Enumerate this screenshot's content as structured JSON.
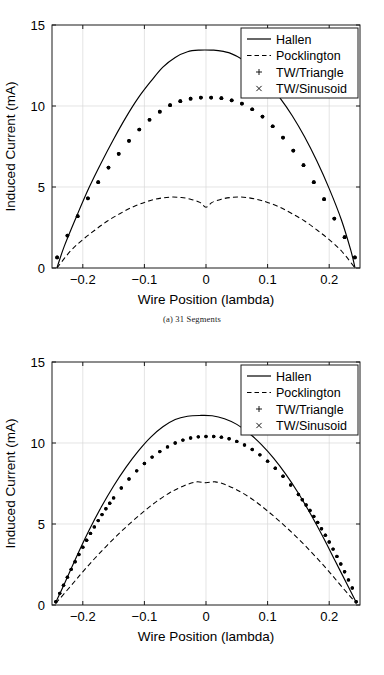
{
  "figure": {
    "panels": [
      {
        "id": "panel-a",
        "caption": "(a)  31 Segments",
        "caption_letter": "(a)",
        "caption_text": "31 Segments"
      },
      {
        "id": "panel-b",
        "caption": "(b)  81 Segments",
        "caption_letter": "(b)",
        "caption_text": "81 Segments"
      }
    ]
  },
  "axes": {
    "xlabel": "Wire Position (lambda)",
    "ylabel": "Induced Current (mA)",
    "xticks": [
      "-0.2",
      "-0.1",
      "0",
      "0.1",
      "0.2"
    ],
    "yticks": [
      "0",
      "5",
      "10",
      "15"
    ]
  },
  "legend": {
    "entries": [
      {
        "label": "Hallen",
        "style": "solid-line"
      },
      {
        "label": "Pocklington",
        "style": "dashed-line"
      },
      {
        "label": "TW/Triangle",
        "style": "plus-marker"
      },
      {
        "label": "TW/Sinusoid",
        "style": "cross-marker"
      }
    ]
  },
  "colors": {
    "line": "#000000",
    "frame": "#1a1a1a",
    "grid": "#d8d8d8",
    "background": "#ffffff"
  },
  "chart_data": [
    {
      "type": "line",
      "title": "(a) 31 Segments",
      "xlabel": "Wire Position (lambda)",
      "ylabel": "Induced Current (mA)",
      "xlim": [
        -0.25,
        0.25
      ],
      "ylim": [
        0,
        15
      ],
      "xticks": [
        -0.2,
        -0.1,
        0,
        0.1,
        0.2
      ],
      "yticks": [
        0,
        5,
        10,
        15
      ],
      "grid": true,
      "legend_position": "upper right",
      "series": [
        {
          "name": "Hallen",
          "style": "solid",
          "x": [
            -0.242,
            -0.23,
            -0.21,
            -0.19,
            -0.17,
            -0.15,
            -0.13,
            -0.11,
            -0.09,
            -0.07,
            -0.05,
            -0.03,
            -0.01,
            0.01,
            0.02,
            0.04,
            0.06,
            0.08,
            0.1,
            0.12,
            0.14,
            0.16,
            0.18,
            0.2,
            0.22,
            0.235,
            0.242
          ],
          "y": [
            0.0,
            1.35,
            3.2,
            4.95,
            6.5,
            7.95,
            9.3,
            10.5,
            11.5,
            12.4,
            13.0,
            13.35,
            13.45,
            13.45,
            13.42,
            13.25,
            12.85,
            12.25,
            11.45,
            10.5,
            9.4,
            8.1,
            6.6,
            4.9,
            2.95,
            1.1,
            0.0
          ]
        },
        {
          "name": "Pocklington",
          "style": "dashed",
          "x": [
            -0.242,
            -0.22,
            -0.2,
            -0.18,
            -0.16,
            -0.14,
            -0.12,
            -0.1,
            -0.085,
            -0.07,
            -0.055,
            -0.04,
            -0.025,
            -0.01,
            0.0,
            0.01,
            0.025,
            0.04,
            0.055,
            0.07,
            0.085,
            0.1,
            0.12,
            0.14,
            0.16,
            0.18,
            0.2,
            0.22,
            0.242
          ],
          "y": [
            0.0,
            1.05,
            1.75,
            2.35,
            2.9,
            3.35,
            3.75,
            4.05,
            4.22,
            4.33,
            4.38,
            4.35,
            4.25,
            4.05,
            3.75,
            4.05,
            4.25,
            4.35,
            4.38,
            4.33,
            4.22,
            4.05,
            3.75,
            3.35,
            2.9,
            2.35,
            1.75,
            1.05,
            0.0
          ]
        },
        {
          "name": "TW/Triangle",
          "style": "markers",
          "marker": "+",
          "x": [
            -0.2417,
            -0.225,
            -0.2083,
            -0.1917,
            -0.175,
            -0.1583,
            -0.1417,
            -0.125,
            -0.1083,
            -0.0917,
            -0.075,
            -0.0583,
            -0.0417,
            -0.025,
            -0.0083,
            0.0083,
            0.025,
            0.0417,
            0.0583,
            0.075,
            0.0917,
            0.1083,
            0.125,
            0.1417,
            0.1583,
            0.175,
            0.1917,
            0.2083,
            0.225,
            0.2417
          ],
          "y": [
            0.65,
            2.0,
            3.2,
            4.3,
            5.3,
            6.2,
            7.05,
            7.85,
            8.55,
            9.15,
            9.65,
            10.05,
            10.3,
            10.45,
            10.52,
            10.52,
            10.48,
            10.35,
            10.15,
            9.8,
            9.35,
            8.75,
            8.05,
            7.25,
            6.35,
            5.3,
            4.25,
            3.05,
            1.9,
            0.65
          ]
        },
        {
          "name": "TW/Sinusoid",
          "style": "markers",
          "marker": "x",
          "x": [
            -0.2417,
            -0.225,
            -0.2083,
            -0.1917,
            -0.175,
            -0.1583,
            -0.1417,
            -0.125,
            -0.1083,
            -0.0917,
            -0.075,
            -0.0583,
            -0.0417,
            -0.025,
            -0.0083,
            0.0083,
            0.025,
            0.0417,
            0.0583,
            0.075,
            0.0917,
            0.1083,
            0.125,
            0.1417,
            0.1583,
            0.175,
            0.1917,
            0.2083,
            0.225,
            0.2417
          ],
          "y": [
            0.65,
            2.0,
            3.2,
            4.3,
            5.3,
            6.2,
            7.05,
            7.85,
            8.55,
            9.15,
            9.65,
            10.05,
            10.3,
            10.45,
            10.52,
            10.52,
            10.48,
            10.35,
            10.15,
            9.8,
            9.35,
            8.75,
            8.05,
            7.25,
            6.35,
            5.3,
            4.25,
            3.05,
            1.9,
            0.65
          ]
        }
      ]
    },
    {
      "type": "line",
      "title": "(b) 81 Segments",
      "xlabel": "Wire Position (lambda)",
      "ylabel": "Induced Current (mA)",
      "xlim": [
        -0.25,
        0.25
      ],
      "ylim": [
        0,
        15
      ],
      "xticks": [
        -0.2,
        -0.1,
        0,
        0.1,
        0.2
      ],
      "yticks": [
        0,
        5,
        10,
        15
      ],
      "grid": true,
      "legend_position": "upper right",
      "series": [
        {
          "name": "Hallen",
          "style": "solid",
          "x": [
            -0.244,
            -0.23,
            -0.21,
            -0.19,
            -0.17,
            -0.15,
            -0.13,
            -0.11,
            -0.09,
            -0.07,
            -0.05,
            -0.03,
            -0.01,
            0.01,
            0.03,
            0.05,
            0.07,
            0.09,
            0.11,
            0.13,
            0.15,
            0.17,
            0.19,
            0.21,
            0.23,
            0.244
          ],
          "y": [
            0.15,
            1.3,
            3.0,
            4.6,
            6.05,
            7.35,
            8.5,
            9.5,
            10.35,
            11.0,
            11.45,
            11.65,
            11.7,
            11.68,
            11.5,
            11.15,
            10.6,
            9.9,
            9.05,
            8.05,
            6.9,
            5.6,
            4.2,
            2.7,
            1.2,
            0.15
          ]
        },
        {
          "name": "Pocklington",
          "style": "dashed",
          "x": [
            -0.244,
            -0.22,
            -0.2,
            -0.18,
            -0.16,
            -0.14,
            -0.12,
            -0.1,
            -0.08,
            -0.06,
            -0.045,
            -0.03,
            -0.015,
            0.0,
            0.015,
            0.03,
            0.045,
            0.06,
            0.08,
            0.1,
            0.12,
            0.14,
            0.16,
            0.18,
            0.2,
            0.22,
            0.244
          ],
          "y": [
            0.1,
            1.15,
            2.05,
            2.9,
            3.7,
            4.45,
            5.15,
            5.8,
            6.4,
            6.9,
            7.2,
            7.45,
            7.6,
            7.55,
            7.6,
            7.45,
            7.2,
            6.9,
            6.4,
            5.8,
            5.15,
            4.45,
            3.7,
            2.9,
            2.05,
            1.15,
            0.1
          ]
        },
        {
          "name": "TW/Triangle",
          "style": "markers",
          "marker": "+",
          "x": [
            -0.2438,
            -0.2375,
            -0.2313,
            -0.225,
            -0.2188,
            -0.2125,
            -0.2063,
            -0.2,
            -0.1938,
            -0.1875,
            -0.1813,
            -0.175,
            -0.1688,
            -0.1625,
            -0.1563,
            -0.15,
            -0.1375,
            -0.125,
            -0.1125,
            -0.1,
            -0.0875,
            -0.075,
            -0.0625,
            -0.05,
            -0.0375,
            -0.025,
            -0.0125,
            0.0,
            0.0125,
            0.025,
            0.0375,
            0.05,
            0.0625,
            0.075,
            0.0875,
            0.1,
            0.1125,
            0.125,
            0.1375,
            0.15,
            0.1563,
            0.1625,
            0.1688,
            0.175,
            0.1813,
            0.1875,
            0.1938,
            0.2,
            0.2063,
            0.2125,
            0.2188,
            0.225,
            0.2313,
            0.2375,
            0.2438
          ],
          "y": [
            0.2,
            0.72,
            1.22,
            1.72,
            2.2,
            2.67,
            3.12,
            3.57,
            4.0,
            4.42,
            4.82,
            5.21,
            5.58,
            5.94,
            6.28,
            6.61,
            7.22,
            7.78,
            8.28,
            8.73,
            9.13,
            9.47,
            9.76,
            10.0,
            10.18,
            10.31,
            10.38,
            10.4,
            10.4,
            10.36,
            10.26,
            10.1,
            9.88,
            9.6,
            9.27,
            8.88,
            8.44,
            7.95,
            7.41,
            6.82,
            6.5,
            6.17,
            5.83,
            5.47,
            5.1,
            4.71,
            4.31,
            3.89,
            3.45,
            3.0,
            2.53,
            2.05,
            1.55,
            1.05,
            0.2
          ]
        },
        {
          "name": "TW/Sinusoid",
          "style": "markers",
          "marker": "x",
          "x": [
            -0.2438,
            -0.2375,
            -0.2313,
            -0.225,
            -0.2188,
            -0.2125,
            -0.2063,
            -0.2,
            -0.1938,
            -0.1875,
            -0.1813,
            -0.175,
            -0.1688,
            -0.1625,
            -0.1563,
            -0.15,
            -0.1375,
            -0.125,
            -0.1125,
            -0.1,
            -0.0875,
            -0.075,
            -0.0625,
            -0.05,
            -0.0375,
            -0.025,
            -0.0125,
            0.0,
            0.0125,
            0.025,
            0.0375,
            0.05,
            0.0625,
            0.075,
            0.0875,
            0.1,
            0.1125,
            0.125,
            0.1375,
            0.15,
            0.1563,
            0.1625,
            0.1688,
            0.175,
            0.1813,
            0.1875,
            0.1938,
            0.2,
            0.2063,
            0.2125,
            0.2188,
            0.225,
            0.2313,
            0.2375,
            0.2438
          ],
          "y": [
            0.2,
            0.72,
            1.22,
            1.72,
            2.2,
            2.67,
            3.12,
            3.57,
            4.0,
            4.42,
            4.82,
            5.21,
            5.58,
            5.94,
            6.28,
            6.61,
            7.22,
            7.78,
            8.28,
            8.73,
            9.13,
            9.47,
            9.76,
            10.0,
            10.18,
            10.31,
            10.38,
            10.4,
            10.4,
            10.36,
            10.26,
            10.1,
            9.88,
            9.6,
            9.27,
            8.88,
            8.44,
            7.95,
            7.41,
            6.82,
            6.5,
            6.17,
            5.83,
            5.47,
            5.1,
            4.71,
            4.31,
            3.89,
            3.45,
            3.0,
            2.53,
            2.05,
            1.55,
            1.05,
            0.2
          ]
        }
      ]
    }
  ]
}
